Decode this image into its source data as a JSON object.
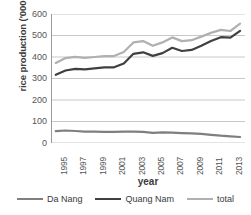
{
  "chart_data": {
    "type": "line",
    "title": "",
    "xlabel": "year",
    "ylabel": "rice production ('000 tons)",
    "ylim": [
      0,
      600
    ],
    "yticks": [
      0,
      100,
      200,
      300,
      400,
      500,
      600
    ],
    "grid": true,
    "legend_position": "bottom",
    "x": [
      1995,
      1996,
      1997,
      1998,
      1999,
      2000,
      2001,
      2002,
      2003,
      2004,
      2005,
      2006,
      2007,
      2008,
      2009,
      2010,
      2011,
      2012,
      2013,
      2014
    ],
    "xtick_labels": [
      "1995",
      "1997",
      "1999",
      "2001",
      "2003",
      "2005",
      "2007",
      "2009",
      "2011",
      "2013"
    ],
    "series": [
      {
        "name": "Da Nang",
        "color": "#7f7f7f",
        "values": [
          55,
          58,
          56,
          53,
          53,
          52,
          52,
          53,
          53,
          52,
          47,
          50,
          48,
          46,
          45,
          43,
          38,
          34,
          31,
          28
        ]
      },
      {
        "name": "Quang Nam",
        "color": "#404040",
        "values": [
          317,
          337,
          345,
          343,
          347,
          352,
          352,
          370,
          415,
          422,
          405,
          418,
          443,
          428,
          433,
          452,
          474,
          492,
          490,
          522
        ]
      },
      {
        "name": "total",
        "color": "#b0b0b0",
        "values": [
          372,
          395,
          401,
          396,
          400,
          404,
          404,
          423,
          468,
          474,
          452,
          468,
          491,
          474,
          478,
          495,
          512,
          526,
          521,
          555
        ]
      }
    ]
  },
  "axes": {
    "ylabel": "rice production ('000 tons)",
    "xlabel": "year",
    "ytick_labels": [
      "600",
      "500",
      "400",
      "300",
      "200",
      "100",
      "0"
    ]
  },
  "legend": {
    "items": [
      {
        "label": "Da Nang",
        "color": "#7f7f7f"
      },
      {
        "label": "Quang Nam",
        "color": "#404040"
      },
      {
        "label": "total",
        "color": "#b0b0b0"
      }
    ]
  },
  "colors": {
    "da_nang": "#7f7f7f",
    "quang_nam": "#404040",
    "total": "#b0b0b0",
    "grid": "#c8c8c8",
    "axis": "#9a9a9a",
    "text": "#3a3a3a",
    "background": "#ffffff"
  }
}
